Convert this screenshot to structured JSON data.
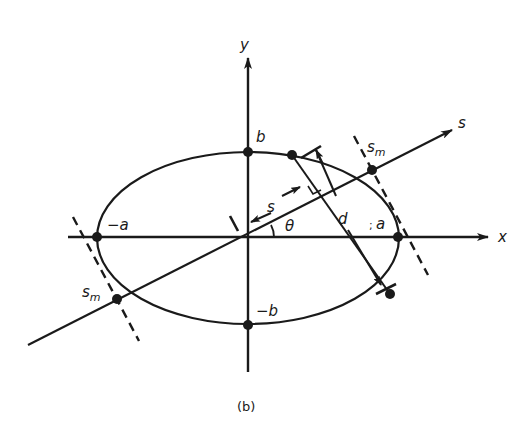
{
  "figure": {
    "caption": "(b)",
    "colors": {
      "ink": "#1a1a1a",
      "background": "#ffffff"
    },
    "axes": {
      "x_label": "x",
      "y_label": "y",
      "s_label": "s"
    },
    "ellipse_labels": {
      "a_pos": "a",
      "a_pos_mark": ";",
      "a_neg": "−a",
      "b_pos": "b",
      "b_neg": "−b"
    },
    "annotations": {
      "theta": "θ",
      "s_distance": "s",
      "d_length": "d",
      "sm_upper_main": "s",
      "sm_upper_sub": "m",
      "sm_lower_main": "s",
      "sm_lower_sub": "m"
    }
  }
}
